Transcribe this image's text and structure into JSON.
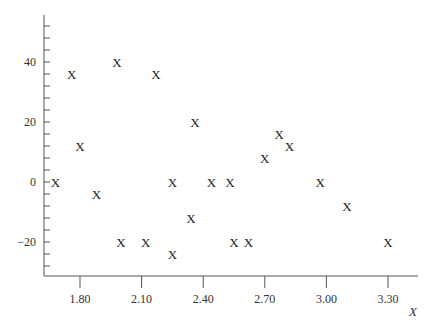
{
  "chart_data": {
    "type": "scatter",
    "title": "",
    "xlabel": "X",
    "ylabel": "",
    "marker": "X",
    "xlim": [
      1.64,
      3.45
    ],
    "ylim": [
      -31,
      55
    ],
    "xticks": [
      1.8,
      2.1,
      2.4,
      2.7,
      3.0,
      3.3
    ],
    "xtick_labels": [
      "1.80",
      "2.10",
      "2.40",
      "2.70",
      "3.00",
      "3.30"
    ],
    "yticks": [
      -20,
      0,
      20,
      40
    ],
    "ytick_labels": [
      "−20",
      "0",
      "20",
      "40"
    ],
    "y_minor_tick_step": 4,
    "grid": false,
    "legend": null,
    "points": [
      {
        "x": 1.68,
        "y": 0
      },
      {
        "x": 1.76,
        "y": 36
      },
      {
        "x": 1.8,
        "y": 12
      },
      {
        "x": 1.88,
        "y": -4
      },
      {
        "x": 1.98,
        "y": 40
      },
      {
        "x": 2.0,
        "y": -20
      },
      {
        "x": 2.12,
        "y": -20
      },
      {
        "x": 2.17,
        "y": 36
      },
      {
        "x": 2.25,
        "y": 0
      },
      {
        "x": 2.25,
        "y": -24
      },
      {
        "x": 2.34,
        "y": -12
      },
      {
        "x": 2.36,
        "y": 20
      },
      {
        "x": 2.44,
        "y": 0
      },
      {
        "x": 2.53,
        "y": 0
      },
      {
        "x": 2.55,
        "y": -20
      },
      {
        "x": 2.62,
        "y": -20
      },
      {
        "x": 2.7,
        "y": 8
      },
      {
        "x": 2.77,
        "y": 16
      },
      {
        "x": 2.82,
        "y": 12
      },
      {
        "x": 2.97,
        "y": 0
      },
      {
        "x": 3.1,
        "y": -8
      },
      {
        "x": 3.3,
        "y": -20
      }
    ]
  },
  "colors": {
    "axis": "#555555",
    "marker": "#222222",
    "text": "#333333"
  }
}
